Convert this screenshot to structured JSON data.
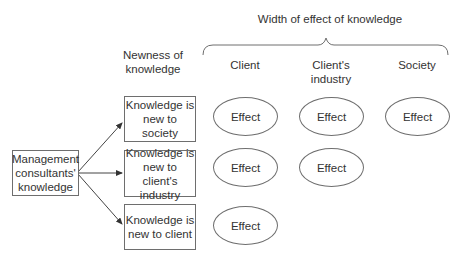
{
  "diagram": {
    "title": "Width of effect of knowledge",
    "row_axis_label": "Newness of\nknowledge",
    "columns": [
      {
        "label": "Client"
      },
      {
        "label": "Client's\nindustry"
      },
      {
        "label": "Society"
      }
    ],
    "source_node": {
      "label": "Management\nconsultants'\nknowledge"
    },
    "rows": [
      {
        "label": "Knowledge is\nnew to society",
        "effects": [
          "Effect",
          "Effect",
          "Effect"
        ]
      },
      {
        "label": "Knowledge is\nnew to client's\nindustry",
        "effects": [
          "Effect",
          "Effect"
        ]
      },
      {
        "label": "Knowledge is\nnew to client",
        "effects": [
          "Effect"
        ]
      }
    ],
    "line_color": "#6e6e6e",
    "text_color": "#333333"
  }
}
